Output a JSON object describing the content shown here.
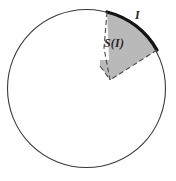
{
  "figure": {
    "type": "geometry-diagram",
    "background_color": "#ffffff",
    "labels": {
      "sector_label": "S(I)",
      "arc_label": "I"
    },
    "colors": {
      "sector_fill": "#b9b9b9",
      "sector_dashed_edge": "#4a4a4a",
      "circle_stroke": "#3a3a3a",
      "arc_highlight_stroke": "#141414",
      "label_text": "#262626"
    },
    "geometry": {
      "circle": {
        "center_x": 86.5,
        "center_y": 88.5,
        "radius": 79,
        "stroke_width": 1.1
      },
      "arc_I": {
        "start_point": [
          107,
          12
        ],
        "end_point": [
          157,
          50
        ],
        "stroke_width": 3.2
      },
      "sector_vertex": [
        110,
        80
      ],
      "edge_style": "dashed",
      "dash_pattern": "5,3"
    }
  }
}
